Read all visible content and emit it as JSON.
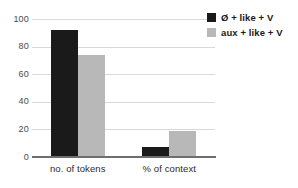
{
  "chart_data": {
    "type": "bar",
    "title": "",
    "xlabel": "",
    "ylabel": "",
    "categories": [
      "no. of tokens",
      "% of context"
    ],
    "series": [
      {
        "name": "Ø + like + V",
        "color": "#1a1a1a",
        "values": [
          92,
          7
        ]
      },
      {
        "name": "aux + like + V",
        "color": "#b8b8b8",
        "values": [
          74,
          19
        ]
      }
    ],
    "ylim": [
      0,
      100
    ],
    "yticks": [
      0,
      20,
      40,
      60,
      80,
      100
    ],
    "ytick_labels": [
      "0",
      "20",
      "40",
      "60",
      "80",
      "100"
    ],
    "grid": true,
    "grid_axis": "y",
    "legend_position": "top-right"
  },
  "legend": {
    "entries": [
      {
        "label": "Ø + like + V"
      },
      {
        "label": "aux + like + V"
      }
    ]
  },
  "colors": {
    "series_black": "#1a1a1a",
    "series_gray": "#b8b8b8",
    "gridline": "#d9d9d9",
    "axis": "#6e6e6e",
    "tick_text": "#4a4a4a",
    "label_text": "#2b2b2b",
    "background": "#ffffff"
  }
}
